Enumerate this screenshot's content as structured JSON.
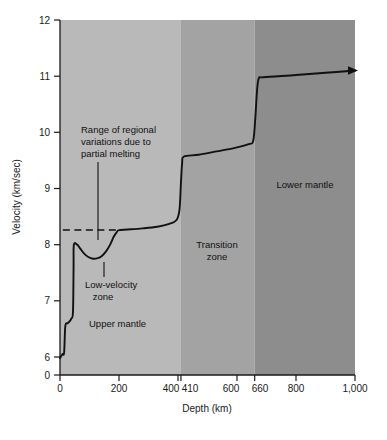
{
  "chart_data": {
    "type": "line",
    "title": "",
    "xlabel": "Depth (km)",
    "ylabel": "Velocity (km/sec)",
    "xlim": [
      0,
      1000
    ],
    "ylim": [
      6,
      12
    ],
    "y_axis_has_zero_break": true,
    "grid": false,
    "legend": "none",
    "xticks": [
      {
        "value": 0,
        "label": "0"
      },
      {
        "value": 200,
        "label": "200"
      },
      {
        "value": 400,
        "label": "400"
      },
      {
        "value": 410,
        "label": "410"
      },
      {
        "value": 600,
        "label": "600"
      },
      {
        "value": 660,
        "label": "660"
      },
      {
        "value": 800,
        "label": "800"
      },
      {
        "value": 1000,
        "label": "1,000"
      }
    ],
    "yticks": [
      {
        "value": 0,
        "label": "0"
      },
      {
        "value": 6,
        "label": "6"
      },
      {
        "value": 7,
        "label": "7"
      },
      {
        "value": 8,
        "label": "8"
      },
      {
        "value": 9,
        "label": "9"
      },
      {
        "value": 10,
        "label": "10"
      },
      {
        "value": 11,
        "label": "11"
      },
      {
        "value": 12,
        "label": "12"
      }
    ],
    "series": [
      {
        "name": "Seismic P-wave velocity",
        "color": "#111111",
        "points": [
          [
            0,
            5.98
          ],
          [
            8,
            6.05
          ],
          [
            14,
            6.08
          ],
          [
            18,
            6.55
          ],
          [
            26,
            6.6
          ],
          [
            30,
            6.62
          ],
          [
            38,
            6.68
          ],
          [
            44,
            6.8
          ],
          [
            46,
            7.6
          ],
          [
            47,
            8.0
          ],
          [
            58,
            8.0
          ],
          [
            62,
            7.98
          ],
          [
            70,
            7.92
          ],
          [
            82,
            7.84
          ],
          [
            96,
            7.78
          ],
          [
            112,
            7.75
          ],
          [
            128,
            7.76
          ],
          [
            142,
            7.8
          ],
          [
            156,
            7.88
          ],
          [
            170,
            8.0
          ],
          [
            182,
            8.14
          ],
          [
            192,
            8.22
          ],
          [
            200,
            8.26
          ],
          [
            230,
            8.27
          ],
          [
            280,
            8.29
          ],
          [
            330,
            8.32
          ],
          [
            370,
            8.37
          ],
          [
            395,
            8.44
          ],
          [
            405,
            8.62
          ],
          [
            410,
            9.1
          ],
          [
            414,
            9.45
          ],
          [
            420,
            9.57
          ],
          [
            470,
            9.6
          ],
          [
            530,
            9.66
          ],
          [
            590,
            9.72
          ],
          [
            640,
            9.79
          ],
          [
            655,
            9.85
          ],
          [
            662,
            10.25
          ],
          [
            668,
            10.75
          ],
          [
            674,
            10.96
          ],
          [
            690,
            10.98
          ],
          [
            800,
            11.02
          ],
          [
            900,
            11.06
          ],
          [
            1000,
            11.1
          ]
        ]
      }
    ],
    "reference_lines": [
      {
        "name": "range-of-regional-variations",
        "style": "dashed",
        "y": 8.26,
        "x_start": 47,
        "x_end": 196
      }
    ],
    "zones": [
      {
        "name": "Upper mantle",
        "x_start": 0,
        "x_end": 410,
        "color": "#b9b9b9"
      },
      {
        "name": "Transition zone",
        "x_start": 410,
        "x_end": 660,
        "color": "#a3a3a3"
      },
      {
        "name": "Lower mantle",
        "x_start": 660,
        "x_end": 1000,
        "color": "#8d8d8d"
      }
    ],
    "annotations": [
      {
        "name": "range-of-regional-variations",
        "text_lines": [
          "Range of regional",
          "variations due to",
          "partial melting"
        ],
        "leader_from": [
          125,
          9.82
        ],
        "leader_to": [
          125,
          8.08
        ]
      },
      {
        "name": "low-velocity-zone",
        "text_lines": [
          "Low-velocity",
          "zone"
        ],
        "leader_from": [
          133,
          7.5
        ],
        "leader_to": [
          133,
          7.76
        ]
      },
      {
        "name": "upper-mantle-zone-label",
        "text_lines": [
          "Upper mantle"
        ],
        "at": [
          185,
          6.85
        ]
      },
      {
        "name": "transition-zone-label",
        "text_lines": [
          "Transition",
          "zone"
        ],
        "at": [
          535,
          7.9
        ]
      },
      {
        "name": "lower-mantle-zone-label",
        "text_lines": [
          "Lower mantle"
        ],
        "at": [
          840,
          9.42
        ]
      }
    ],
    "arrow_end": {
      "x": 1000,
      "y": 11.1,
      "direction": "right"
    }
  },
  "colors": {
    "background": "#ffffff",
    "axis": "#1a1a1a",
    "curve": "#111111",
    "upper_mantle": "#b9b9b9",
    "transition_zone": "#a3a3a3",
    "lower_mantle": "#8d8d8d",
    "text": "#111111"
  },
  "axes": {
    "x_title": "Depth (km)",
    "y_title": "Velocity (km/sec)"
  },
  "xtick_labels": {
    "t0": "0",
    "t200": "200",
    "t400": "400",
    "t410": "410",
    "t600": "600",
    "t660": "660",
    "t800": "800",
    "t1000": "1,000"
  },
  "ytick_labels": {
    "t0": "0",
    "t6": "6",
    "t7": "7",
    "t8": "8",
    "t9": "9",
    "t10": "10",
    "t11": "11",
    "t12": "12"
  },
  "zone_labels": {
    "upper_mantle": "Upper mantle",
    "transition_zone_line1": "Transition",
    "transition_zone_line2": "zone",
    "lower_mantle": "Lower mantle"
  },
  "annotation_labels": {
    "range_line1": "Range of regional",
    "range_line2": "variations due to",
    "range_line3": "partial melting",
    "lvz_line1": "Low-velocity",
    "lvz_line2": "zone"
  }
}
